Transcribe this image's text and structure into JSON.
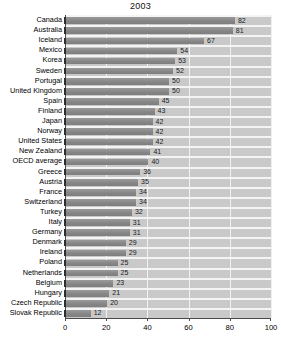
{
  "chart_data": {
    "type": "bar",
    "orientation": "horizontal",
    "title": "2003",
    "xlabel": "",
    "ylabel": "",
    "xlim": [
      0,
      100
    ],
    "xticks": [
      0,
      20,
      40,
      60,
      80,
      100
    ],
    "grid": true,
    "legend": false,
    "categories": [
      "Canada",
      "Australia",
      "Iceland",
      "Mexico",
      "Korea",
      "Sweden",
      "Portugal",
      "United Kingdom",
      "Spain",
      "Finland",
      "Japan",
      "Norway",
      "United States",
      "New Zealand",
      "OECD average",
      "Greece",
      "Austria",
      "France",
      "Switzerland",
      "Turkey",
      "Italy",
      "Germany",
      "Denmark",
      "Ireland",
      "Poland",
      "Netherlands",
      "Belgium",
      "Hungary",
      "Czech Republic",
      "Slovak Republic"
    ],
    "values": [
      82,
      81,
      67,
      54,
      53,
      52,
      50,
      50,
      45,
      43,
      42,
      42,
      42,
      41,
      40,
      36,
      35,
      34,
      34,
      32,
      31,
      31,
      29,
      29,
      25,
      25,
      23,
      21,
      20,
      12
    ],
    "colors": {
      "bar": "#8c8c8c",
      "plot_background": "#c9c9c9",
      "gridline": "#f2f2f2",
      "axis": "#4a4a4a",
      "text": "#000000",
      "page_background": "#ffffff"
    }
  }
}
